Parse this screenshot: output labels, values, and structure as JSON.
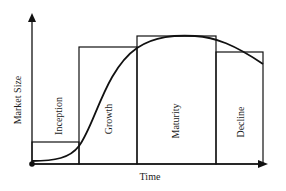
{
  "diagram": {
    "x_axis_label": "Time",
    "y_axis_label": "Market Size",
    "stages": [
      {
        "label": "Inception"
      },
      {
        "label": "Growth"
      },
      {
        "label": "Maturity"
      },
      {
        "label": "Decline"
      }
    ],
    "colors": {
      "line": "#111111",
      "background": "#ffffff"
    }
  }
}
